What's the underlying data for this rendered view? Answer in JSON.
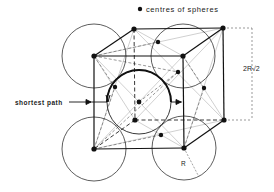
{
  "legend": {
    "marker": "filled-dot",
    "label": "centres of spheres"
  },
  "labels": {
    "shortest_path": "shortest path",
    "dimension": "2R√2",
    "radius": "R"
  },
  "colors": {
    "ink": "#1a1a1a",
    "thin": "#555555",
    "light": "#aaaaaa",
    "background": "#ffffff"
  },
  "geometry": {
    "sphere_radius_px": 32,
    "cube_corners": {
      "front_top_left": [
        94,
        56
      ],
      "front_top_right": [
        183,
        56
      ],
      "front_bottom_left": [
        94,
        149
      ],
      "front_bottom_right": [
        184,
        148
      ],
      "back_top_left": [
        134,
        29
      ],
      "back_top_right": [
        223,
        28
      ],
      "back_bottom_left": [
        135,
        120
      ],
      "back_bottom_right": [
        224,
        120
      ]
    },
    "face_centres": {
      "front": [
        139,
        102
      ],
      "back": [
        178,
        72
      ],
      "top": [
        158,
        42
      ],
      "bottom": [
        161,
        135
      ],
      "left": [
        115,
        87
      ],
      "right": [
        204,
        88
      ]
    }
  }
}
